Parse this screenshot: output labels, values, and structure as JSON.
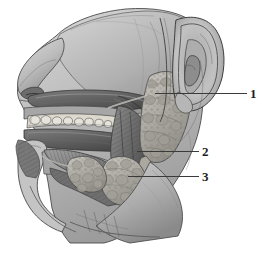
{
  "figure": {
    "background_color": "#ffffff",
    "ink_color": "#3a3a3a",
    "style": "grayscale medical illustration",
    "width": 263,
    "height": 255
  },
  "labels": [
    {
      "number": "1",
      "name": "parotid-gland",
      "leader_x": 155,
      "leader_y": 93,
      "leader_width": 92,
      "text_x": 250,
      "text_y": 87
    },
    {
      "number": "2",
      "name": "submandibular-gland",
      "leader_x": 137,
      "leader_y": 151,
      "leader_width": 62,
      "text_x": 202,
      "text_y": 145
    },
    {
      "number": "3",
      "name": "sublingual-gland",
      "leader_x": 128,
      "leader_y": 176,
      "leader_width": 71,
      "text_x": 202,
      "text_y": 170
    }
  ],
  "structures": [
    {
      "name": "nose",
      "shade": "#b9b9b9"
    },
    {
      "name": "cheek",
      "shade": "#c2c2c2"
    },
    {
      "name": "auricle-ear",
      "shade": "#bdbdbd"
    },
    {
      "name": "teeth",
      "shade": "#e2e0da"
    },
    {
      "name": "hard-palate",
      "shade": "#9a9a9a"
    },
    {
      "name": "tongue",
      "shade": "#8f8f8f"
    },
    {
      "name": "parotid-gland",
      "shade": "#b4b2ab"
    },
    {
      "name": "submandibular-gland",
      "shade": "#b0aea6"
    },
    {
      "name": "sublingual-gland",
      "shade": "#b2b0a8"
    },
    {
      "name": "masseter-muscle",
      "shade": "#7a7a7a"
    },
    {
      "name": "mandible",
      "shade": "#9d9d9d"
    },
    {
      "name": "neck",
      "shade": "#c6c6c6"
    }
  ]
}
